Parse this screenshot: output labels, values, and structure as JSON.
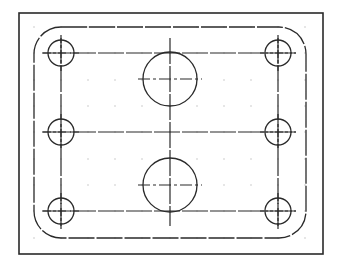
{
  "drawing": {
    "title": "Plate with rounded corners, six bolt holes and two bores",
    "colors": {
      "background": "#ffffff",
      "line": "#2a2a2a",
      "grid_dot": "#9a9a9a"
    },
    "frame": {
      "x": 19,
      "y": 13,
      "width": 304,
      "height": 241
    },
    "profile": {
      "x": 34,
      "y": 27,
      "width": 272,
      "height": 211,
      "corner_radius": 27
    },
    "construction_lines": {
      "horizontal_y": [
        53,
        132,
        211
      ],
      "vertical_x": [
        61,
        170,
        278
      ],
      "x_span": [
        42,
        296
      ],
      "y_span": [
        38,
        226
      ]
    },
    "small_holes": [
      {
        "name": "top-left",
        "cx": 61,
        "cy": 53,
        "r": 13
      },
      {
        "name": "top-right",
        "cx": 278,
        "cy": 53,
        "r": 13
      },
      {
        "name": "middle-left",
        "cx": 61,
        "cy": 132,
        "r": 13
      },
      {
        "name": "middle-right",
        "cx": 278,
        "cy": 132,
        "r": 13
      },
      {
        "name": "bottom-left",
        "cx": 61,
        "cy": 211,
        "r": 13
      },
      {
        "name": "bottom-right",
        "cx": 278,
        "cy": 211,
        "r": 13
      }
    ],
    "large_bores": [
      {
        "name": "upper",
        "cx": 170,
        "cy": 79,
        "r": 27
      },
      {
        "name": "lower",
        "cx": 170,
        "cy": 185,
        "r": 27
      }
    ],
    "grid": {
      "x": [
        34,
        61,
        88,
        115,
        142,
        170,
        197,
        224,
        251,
        278,
        305
      ],
      "y": [
        27,
        53,
        80,
        106,
        132,
        159,
        185,
        211,
        238
      ]
    }
  }
}
